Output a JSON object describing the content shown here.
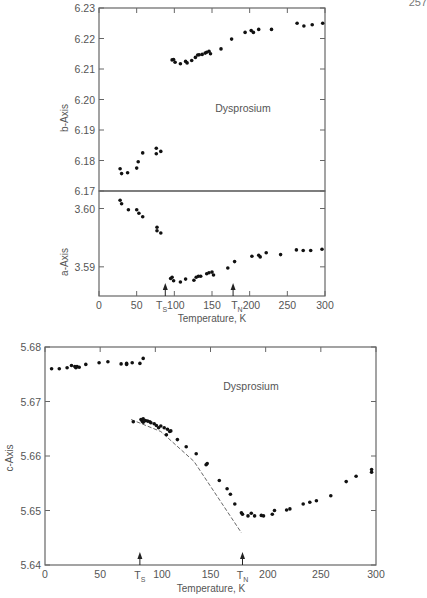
{
  "page": {
    "number": "257"
  },
  "chart_data": [
    {
      "type": "scatter",
      "title": "",
      "annotation": "Dysprosium",
      "xlabel": "Temperature, K",
      "ylabel": "b-Axis",
      "xlim": [
        0,
        300
      ],
      "ylim": [
        6.17,
        6.23
      ],
      "xticks": [
        0,
        50,
        100,
        150,
        200,
        250,
        300
      ],
      "yticks": [
        6.17,
        6.18,
        6.19,
        6.2,
        6.21,
        6.22,
        6.23
      ],
      "ytick_labels": [
        "6.17",
        "6.18",
        "6.19",
        "6.20",
        "6.21",
        "6.22",
        "6.23"
      ],
      "grid": false,
      "points": [
        [
          28,
          6.1773
        ],
        [
          30,
          6.1757
        ],
        [
          38,
          6.176
        ],
        [
          50,
          6.1775
        ],
        [
          52,
          6.1796
        ],
        [
          58,
          6.1825
        ],
        [
          76,
          6.184
        ],
        [
          76,
          6.1822
        ],
        [
          82,
          6.183
        ],
        [
          97,
          6.213
        ],
        [
          99,
          6.2131
        ],
        [
          101,
          6.2122
        ],
        [
          108,
          6.2117
        ],
        [
          115,
          6.2125
        ],
        [
          117,
          6.212
        ],
        [
          123,
          6.2128
        ],
        [
          128,
          6.2138
        ],
        [
          131,
          6.2146
        ],
        [
          133,
          6.2147
        ],
        [
          137,
          6.2148
        ],
        [
          141,
          6.2152
        ],
        [
          143,
          6.2155
        ],
        [
          146,
          6.2158
        ],
        [
          148,
          6.215
        ],
        [
          162,
          6.2166
        ],
        [
          176,
          6.2198
        ],
        [
          194,
          6.222
        ],
        [
          202,
          6.2226
        ],
        [
          205,
          6.222
        ],
        [
          212,
          6.223
        ],
        [
          229,
          6.223
        ],
        [
          263,
          6.225
        ],
        [
          272,
          6.2241
        ],
        [
          283,
          6.2245
        ],
        [
          297,
          6.225
        ]
      ]
    },
    {
      "type": "scatter",
      "title": "",
      "xlabel": "Temperature, K",
      "ylabel": "a-Axis",
      "xlim": [
        0,
        300
      ],
      "ylim": [
        3.585,
        3.603
      ],
      "xticks": [
        0,
        50,
        100,
        150,
        200,
        250,
        300
      ],
      "xtick_labels": [
        "0",
        "50",
        "T_S 100",
        "150",
        "T_N 200",
        "250",
        "300"
      ],
      "yticks": [
        3.59,
        3.6
      ],
      "ytick_labels": [
        "3.59",
        "3.60"
      ],
      "markers": [
        {
          "label": "T_S",
          "x": 88
        },
        {
          "label": "T_N",
          "x": 178
        }
      ],
      "grid": false,
      "points": [
        [
          28,
          3.6014
        ],
        [
          30,
          3.6008
        ],
        [
          39,
          3.5998
        ],
        [
          50,
          3.5998
        ],
        [
          53,
          3.5992
        ],
        [
          58,
          3.5986
        ],
        [
          77,
          3.5968
        ],
        [
          77,
          3.5962
        ],
        [
          82,
          3.5958
        ],
        [
          95,
          3.588
        ],
        [
          97,
          3.5882
        ],
        [
          99,
          3.5876
        ],
        [
          108,
          3.5874
        ],
        [
          115,
          3.5879
        ],
        [
          126,
          3.5877
        ],
        [
          129,
          3.5882
        ],
        [
          132,
          3.5884
        ],
        [
          135,
          3.5884
        ],
        [
          143,
          3.5888
        ],
        [
          146,
          3.589
        ],
        [
          150,
          3.5891
        ],
        [
          152,
          3.5886
        ],
        [
          171,
          3.5898
        ],
        [
          180,
          3.5909
        ],
        [
          203,
          3.5918
        ],
        [
          212,
          3.592
        ],
        [
          214,
          3.5917
        ],
        [
          222,
          3.5924
        ],
        [
          241,
          3.5921
        ],
        [
          262,
          3.5929
        ],
        [
          271,
          3.5928
        ],
        [
          281,
          3.5928
        ],
        [
          296,
          3.593
        ]
      ]
    },
    {
      "type": "scatter",
      "title": "",
      "annotation": "Dysprosium",
      "xlabel": "Temperature, K",
      "ylabel": "c-Axis",
      "xlim": [
        0,
        300
      ],
      "ylim": [
        5.64,
        5.68
      ],
      "xticks": [
        0,
        50,
        100,
        150,
        200,
        250,
        300
      ],
      "xtick_labels": [
        "0",
        "50",
        "T_S 100",
        "150",
        "T_N 200",
        "250",
        "300"
      ],
      "yticks": [
        5.64,
        5.65,
        5.66,
        5.67,
        5.68
      ],
      "ytick_labels": [
        "5.64",
        "5.65",
        "5.66",
        "5.67",
        "5.68"
      ],
      "markers": [
        {
          "label": "T_S",
          "x": 86
        },
        {
          "label": "T_N",
          "x": 179
        }
      ],
      "grid": false,
      "dashed_line": [
        [
          78,
          5.6667
        ],
        [
          105,
          5.6645
        ],
        [
          135,
          5.659
        ],
        [
          178,
          5.6459
        ]
      ],
      "points": [
        [
          6,
          5.676
        ],
        [
          13,
          5.676
        ],
        [
          20,
          5.6762
        ],
        [
          24,
          5.6766
        ],
        [
          27,
          5.6764
        ],
        [
          28,
          5.6762
        ],
        [
          29,
          5.6764
        ],
        [
          31,
          5.6763
        ],
        [
          37,
          5.6768
        ],
        [
          49,
          5.6771
        ],
        [
          57,
          5.6773
        ],
        [
          69,
          5.6769
        ],
        [
          74,
          5.677
        ],
        [
          74,
          5.6768
        ],
        [
          79,
          5.6771
        ],
        [
          86,
          5.677
        ],
        [
          89,
          5.6779
        ],
        [
          80,
          5.6663
        ],
        [
          87,
          5.6667
        ],
        [
          88,
          5.6664
        ],
        [
          89,
          5.6668
        ],
        [
          89,
          5.6662
        ],
        [
          91,
          5.6665
        ],
        [
          93,
          5.6664
        ],
        [
          95,
          5.6663
        ],
        [
          96,
          5.6661
        ],
        [
          99,
          5.6659
        ],
        [
          101,
          5.6656
        ],
        [
          103,
          5.6652
        ],
        [
          105,
          5.6655
        ],
        [
          108,
          5.6652
        ],
        [
          111,
          5.6649
        ],
        [
          113,
          5.6645
        ],
        [
          114,
          5.6646
        ],
        [
          110,
          5.6639
        ],
        [
          120,
          5.663
        ],
        [
          128,
          5.6617
        ],
        [
          137,
          5.6604
        ],
        [
          146,
          5.6584
        ],
        [
          147,
          5.6586
        ],
        [
          158,
          5.6555
        ],
        [
          165,
          5.654
        ],
        [
          168,
          5.653
        ],
        [
          172,
          5.6512
        ],
        [
          178,
          5.6496
        ],
        [
          179,
          5.6493
        ],
        [
          184,
          5.649
        ],
        [
          187,
          5.6495
        ],
        [
          190,
          5.649
        ],
        [
          196,
          5.6491
        ],
        [
          198,
          5.649
        ],
        [
          206,
          5.6493
        ],
        [
          208,
          5.65
        ],
        [
          219,
          5.6501
        ],
        [
          222,
          5.6503
        ],
        [
          234,
          5.6512
        ],
        [
          240,
          5.6515
        ],
        [
          246,
          5.6518
        ],
        [
          259,
          5.6527
        ],
        [
          273,
          5.6553
        ],
        [
          282,
          5.6563
        ],
        [
          296,
          5.657
        ],
        [
          296,
          5.6575
        ]
      ]
    }
  ],
  "labels": {
    "top_xlabel": "Temperature, K",
    "bottom_xlabel": "Temperature, K",
    "b_axis": "b-Axis",
    "a_axis": "a-Axis",
    "c_axis": "c-Axis",
    "annotation": "Dysprosium"
  }
}
